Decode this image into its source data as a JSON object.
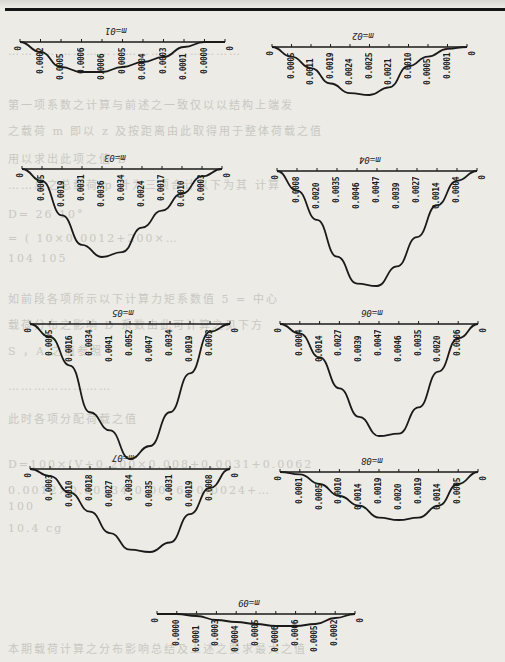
{
  "page": {
    "background": "#ecebe6",
    "ink": "#1a1a1a",
    "ghost_text_lines": [
      "………………………………………………",
      "第一项系数之计算与前述之一致仅以以结构上端发",
      "之载荷 m 即以 z 及按距离由此取得用于整体荷载之值",
      "用以求出此项之值  B",
      "……总之总载荷 p 计为三项合计以下为其  计算",
      "D= 26 10°",
      "= ( 10×0.0012+200×…",
      "104       105",
      "如前段各项所示以下计算力矩系数值 5 = 中心",
      "载荷分布之影响 D 系数由此可计算之见下方",
      "S ，A 之值参照",
      "……………………",
      "此时各项分配荷载之值",
      "D=100×(V+0.200×0.008+0.0031+0.0062",
      "0.0012×0.00134 0.0016+0.0024+…",
      "100",
      "10.4 cg",
      "本期载荷计算之分布影响总结及上述之要求最大之值"
    ]
  },
  "chart_data": [
    {
      "type": "line",
      "title": "m=01",
      "x": [
        1,
        2,
        3,
        4,
        5,
        6,
        7,
        8,
        9
      ],
      "values": [
        0.0002,
        0.0005,
        0.0006,
        0.0006,
        0.0005,
        0.0004,
        0.0003,
        0.0001,
        0.0
      ],
      "end_labels": [
        "0",
        "0"
      ]
    },
    {
      "type": "line",
      "title": "m=02",
      "x": [
        1,
        2,
        3,
        4,
        5,
        6,
        7,
        8,
        9
      ],
      "values": [
        0.0005,
        0.0011,
        0.0019,
        0.0024,
        0.0025,
        0.0021,
        0.001,
        0.0005,
        0.0001
      ],
      "end_labels": [
        "0",
        "0"
      ]
    },
    {
      "type": "line",
      "title": "m=03",
      "x": [
        1,
        2,
        3,
        4,
        5,
        6,
        7,
        8,
        9
      ],
      "values": [
        0.0005,
        0.0019,
        0.0031,
        0.0036,
        0.0034,
        0.0024,
        0.0017,
        0.001,
        0.0003
      ],
      "end_labels": [
        "0",
        "0"
      ]
    },
    {
      "type": "line",
      "title": "m=04",
      "x": [
        1,
        2,
        3,
        4,
        5,
        6,
        7,
        8,
        9
      ],
      "values": [
        0.0008,
        0.002,
        0.0035,
        0.0046,
        0.0047,
        0.0039,
        0.0027,
        0.0014,
        0.0004
      ],
      "end_labels": [
        "0",
        "0"
      ]
    },
    {
      "type": "line",
      "title": "m=05",
      "x": [
        1,
        2,
        3,
        4,
        5,
        6,
        7,
        8,
        9
      ],
      "values": [
        0.0005,
        0.0016,
        0.0034,
        0.0041,
        0.0052,
        0.0047,
        0.0034,
        0.0019,
        0.0003
      ],
      "end_labels": [
        "0",
        "0"
      ]
    },
    {
      "type": "line",
      "title": "m=06",
      "x": [
        1,
        2,
        3,
        4,
        5,
        6,
        7,
        8,
        9
      ],
      "values": [
        0.0004,
        0.0014,
        0.0027,
        0.0039,
        0.0047,
        0.0046,
        0.0035,
        0.002,
        0.0006
      ],
      "end_labels": [
        "0",
        "0"
      ]
    },
    {
      "type": "line",
      "title": "m=07",
      "x": [
        1,
        2,
        3,
        4,
        5,
        6,
        7,
        8,
        9
      ],
      "values": [
        0.0003,
        0.001,
        0.0018,
        0.0027,
        0.0034,
        0.0035,
        0.0031,
        0.0019,
        0.0008
      ],
      "end_labels": [
        "0",
        "0"
      ]
    },
    {
      "type": "line",
      "title": "m=08",
      "x": [
        1,
        2,
        3,
        4,
        5,
        6,
        7,
        8,
        9
      ],
      "values": [
        0.0001,
        0.0005,
        0.001,
        0.0014,
        0.0019,
        0.002,
        0.0019,
        0.0014,
        0.0005
      ],
      "end_labels": [
        "0",
        "0"
      ]
    },
    {
      "type": "line",
      "title": "m=09",
      "x": [
        1,
        2,
        3,
        4,
        5,
        6,
        7,
        8,
        9
      ],
      "values": [
        0.0,
        0.0001,
        0.0003,
        0.0004,
        0.0005,
        0.0006,
        0.0006,
        0.0005,
        0.0002
      ],
      "end_labels": [
        "0",
        "0"
      ]
    }
  ],
  "layout": [
    {
      "left": 20,
      "top": 28,
      "width": 205,
      "depth": 30,
      "label_top": 48
    },
    {
      "left": 272,
      "top": 33,
      "width": 195,
      "depth": 48,
      "label_top": 48
    },
    {
      "left": 22,
      "top": 155,
      "width": 200,
      "depth": 88,
      "label_top": 170
    },
    {
      "left": 277,
      "top": 157,
      "width": 200,
      "depth": 115,
      "label_top": 172
    },
    {
      "left": 30,
      "top": 310,
      "width": 200,
      "depth": 135,
      "label_top": 325
    },
    {
      "left": 280,
      "top": 310,
      "width": 198,
      "depth": 112,
      "label_top": 325
    },
    {
      "left": 30,
      "top": 455,
      "width": 200,
      "depth": 83,
      "label_top": 470
    },
    {
      "left": 280,
      "top": 458,
      "width": 198,
      "depth": 48,
      "label_top": 472
    },
    {
      "left": 157,
      "top": 600,
      "width": 198,
      "depth": 12,
      "label_top": 605
    }
  ]
}
